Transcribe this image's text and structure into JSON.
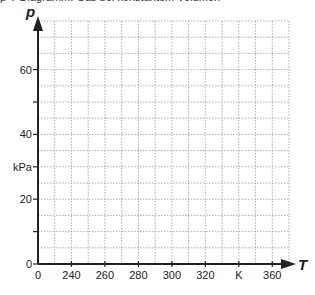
{
  "header": {
    "cut_text": "p-T-Diagramm: Gas bei konstantem Volumen"
  },
  "chart_data": {
    "type": "line",
    "title": "",
    "xlabel": "T",
    "ylabel": "p",
    "x_unit": "K",
    "y_unit": "kPa",
    "x_axis": {
      "origin_label": "0",
      "broken_axis": true,
      "tick_labels": [
        "0",
        "240",
        "260",
        "280",
        "300",
        "320",
        "K",
        "360"
      ],
      "tick_values": [
        0,
        240,
        260,
        280,
        300,
        320,
        340,
        360
      ],
      "grid_step": 10,
      "range_shown": [
        220,
        370
      ]
    },
    "y_axis": {
      "tick_labels": [
        "0",
        "20",
        "kPa",
        "40",
        "60"
      ],
      "tick_values": [
        0,
        20,
        30,
        40,
        60
      ],
      "unlabeled_ticks": [
        10,
        50
      ],
      "grid_step": 5,
      "ylim": [
        0,
        75
      ]
    },
    "grid": true,
    "grid_style": "dotted",
    "series": []
  }
}
